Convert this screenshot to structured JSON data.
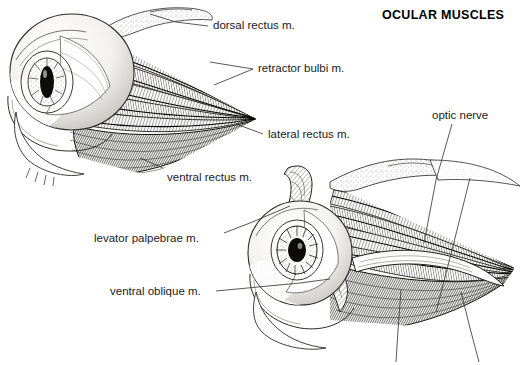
{
  "title": {
    "text": "OCULAR MUSCLES",
    "x": 382,
    "y": 8
  },
  "colors": {
    "ink": "#1a1a1a",
    "leader": "#3a3a3a",
    "paper": "#ffffff",
    "muscle_light": "#d8d6d2",
    "muscle_mid": "#9a9893",
    "muscle_dark": "#55534f",
    "shadow": "#2b2a28"
  },
  "labels": [
    {
      "id": "dorsal-rectus",
      "text": "dorsal rectus m.",
      "x": 213,
      "y": 20
    },
    {
      "id": "retractor-bulbi",
      "text": "retractor bulbi m.",
      "x": 258,
      "y": 63
    },
    {
      "id": "lateral-rectus",
      "text": "lateral rectus m.",
      "x": 268,
      "y": 129
    },
    {
      "id": "ventral-rectus",
      "text": "ventral rectus m.",
      "x": 167,
      "y": 172
    },
    {
      "id": "levator-palpebrae",
      "text": "levator palpebrae m.",
      "x": 94,
      "y": 233
    },
    {
      "id": "ventral-oblique",
      "text": "ventral oblique m.",
      "x": 110,
      "y": 286
    },
    {
      "id": "optic-nerve",
      "text": "optic nerve",
      "x": 432,
      "y": 110
    }
  ],
  "leaders": [
    {
      "id": "leader-dorsal-rectus",
      "points": "208,26 176,22 150,14"
    },
    {
      "id": "leader-retractor-bulbi-a",
      "points": "253,69 210,62"
    },
    {
      "id": "leader-retractor-bulbi-b",
      "points": "253,69 214,85"
    },
    {
      "id": "leader-lateral-rectus",
      "points": "263,134 236,124"
    },
    {
      "id": "leader-ventral-rectus",
      "points": "163,168 140,158"
    },
    {
      "id": "leader-levator-palpebrae",
      "points": "224,233 250,223 290,206"
    },
    {
      "id": "leader-ventral-oblique",
      "points": "216,291 300,283 330,279"
    },
    {
      "id": "leader-optic-nerve",
      "points": "452,124 436,180 424,243"
    },
    {
      "id": "leader-orbit-a",
      "points": "470,178 452,250 436,312"
    },
    {
      "id": "leader-orbit-b",
      "points": "401,290 398,330 396,362"
    },
    {
      "id": "leader-orbit-c",
      "points": "461,292 470,328 479,362"
    }
  ],
  "figures": [
    {
      "id": "upper-left-eye",
      "description": "left ocular globe with converging extraocular muscle bands to orbital apex"
    },
    {
      "id": "lower-right-eye",
      "description": "right ocular globe, deeper dissection showing optic nerve and oblique muscles"
    }
  ],
  "anatomy": {
    "globe_upper": {
      "cx": 72,
      "cy": 72,
      "rx": 62,
      "ry": 58
    },
    "pupil_upper": {
      "cx": 47,
      "cy": 82,
      "rx": 7,
      "ry": 16
    },
    "apex_upper": {
      "x": 256,
      "y": 119
    },
    "globe_lower": {
      "cx": 300,
      "cy": 253,
      "rx": 52,
      "ry": 52
    },
    "pupil_lower": {
      "cx": 297,
      "cy": 250,
      "rx": 9,
      "ry": 12
    },
    "apex_lower": {
      "x": 508,
      "y": 286
    }
  }
}
